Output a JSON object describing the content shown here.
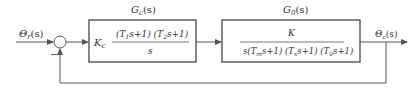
{
  "diagram": {
    "type": "block-diagram",
    "input": {
      "symbol": "Θ",
      "sub": "r",
      "arg": "(s)"
    },
    "output": {
      "symbol": "Θ",
      "sub": "c",
      "arg": "(s)"
    },
    "summing_junction": {
      "feedback_sign": "−"
    },
    "controller": {
      "title": {
        "main": "G",
        "sub": "c",
        "arg": "(s)"
      },
      "gain": {
        "main": "K",
        "sub": "c"
      },
      "numerator": [
        "(T",
        "1",
        "s+1) (T",
        "2",
        "s+1)"
      ],
      "denominator": "s"
    },
    "plant": {
      "title": {
        "main": "G",
        "sub": "0",
        "arg": "(s)"
      },
      "numerator": "K",
      "denominator": [
        "s(T",
        "m",
        "s+1) (T",
        "x",
        "s+1) (T",
        "0",
        "s+1)"
      ]
    },
    "feedback": "unity"
  },
  "colors": {
    "line": "#555555",
    "text": "#333333",
    "box": "#444444"
  }
}
